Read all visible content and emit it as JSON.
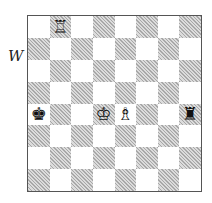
{
  "side_to_move_label": "W",
  "board": {
    "orientation": "white-bottom",
    "files": [
      "a",
      "b",
      "c",
      "d",
      "e",
      "f",
      "g",
      "h"
    ],
    "ranks": [
      8,
      7,
      6,
      5,
      4,
      3,
      2,
      1
    ],
    "light_color": "#ffffff",
    "dark_color": "#c8c8c8 (hatched)",
    "pieces": [
      {
        "square": "b8",
        "type": "rook",
        "color": "white",
        "glyph": "♖"
      },
      {
        "square": "a4",
        "type": "king",
        "color": "black",
        "glyph": "♚"
      },
      {
        "square": "d4",
        "type": "king",
        "color": "white",
        "glyph": "♔"
      },
      {
        "square": "e4",
        "type": "bishop",
        "color": "white",
        "glyph": "♗"
      },
      {
        "square": "h4",
        "type": "rook",
        "color": "black",
        "glyph": "♜"
      }
    ]
  }
}
